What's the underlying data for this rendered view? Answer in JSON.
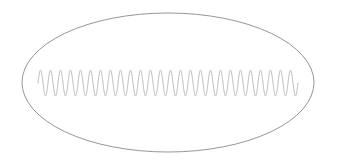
{
  "canvas": {
    "width": 338,
    "height": 165,
    "background_color": "#ffffff",
    "title": "Ellipse containing oscillating waveform"
  },
  "figure": {
    "name": "ellipse-with-waveform-diagram"
  },
  "ellipse": {
    "center_x": 168,
    "center_y": 82.5,
    "radius_x": 146,
    "radius_y": 69.5,
    "stroke_color": "#8a8a8e",
    "stroke_width": 0.9,
    "fill": "none"
  },
  "waveform": {
    "shape": "sine",
    "x_start": 38,
    "x_end": 298,
    "baseline_y": 83,
    "amplitude": 13,
    "period": 10,
    "cycles": 26,
    "stroke_color": "#b9b9bd",
    "stroke_width": 0.9,
    "fill": "none",
    "samples_per_cycle": 24,
    "phase_offset": 0
  },
  "chart_data": {
    "type": "line",
    "title": "",
    "xlabel": "",
    "ylabel": "",
    "xlim": [
      38,
      298
    ],
    "ylim": [
      70,
      96
    ],
    "grid": false,
    "legend": "none",
    "series": [
      {
        "name": "oscillation",
        "function": "y = 83 - 13 * sin(2*pi*(x-38)/10)",
        "amplitude": 13,
        "period": 10,
        "cycles": 26,
        "baseline": 83,
        "peak_y": 70,
        "trough_y": 96
      }
    ],
    "annotations": []
  }
}
